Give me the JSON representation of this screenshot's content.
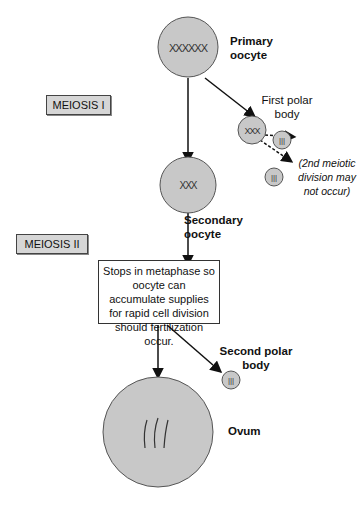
{
  "diagram": {
    "colors": {
      "cell_fill": "#c8c8c8",
      "cell_stroke": "#555555",
      "stage_fill": "#d6d6d6",
      "arrow": "#111111"
    },
    "cells": {
      "primary_oocyte": {
        "label": "Primary oocyte",
        "line1": "Primary",
        "line2": "oocyte",
        "chromosomes": "XXXXXX"
      },
      "first_polar_body": {
        "label": "First polar body",
        "line1": "First polar",
        "line2": "body",
        "chromosomes": "XXX"
      },
      "secondary_oocyte": {
        "label": "Secondary oocyte",
        "line1": "Secondary",
        "line2": "oocyte",
        "chromosomes": "XXX"
      },
      "second_polar_body": {
        "label": "Second polar body",
        "line1": "Second polar",
        "line2": "body"
      },
      "ovum": {
        "label": "Ovum"
      }
    },
    "stages": {
      "meiosis_1": "MEIOSIS I",
      "meiosis_2": "MEIOSIS II"
    },
    "note": "Stops in metaphase so oocyte can accumulate supplies for rapid cell division should fertilization occur.",
    "polar_note": {
      "line1": "(2nd meiotic",
      "line2": "division may",
      "line3": "not occur)"
    }
  }
}
